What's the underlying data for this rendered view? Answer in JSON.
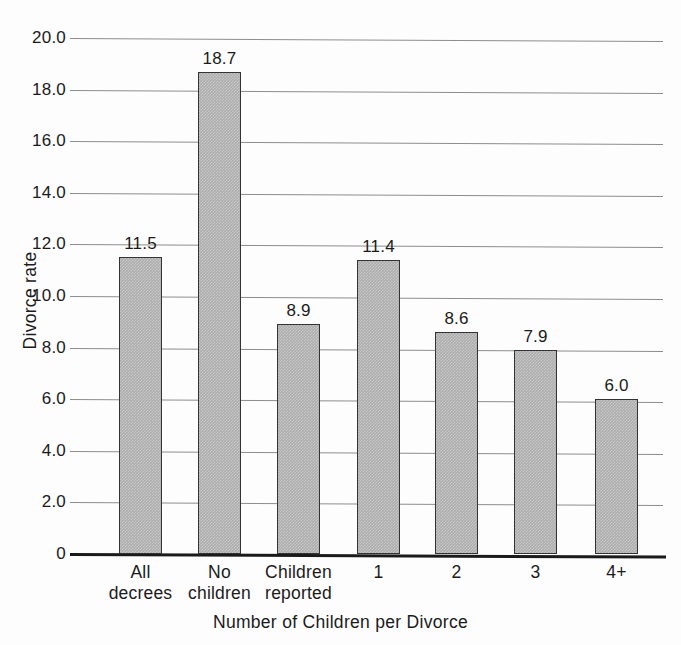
{
  "chart_data": {
    "type": "bar",
    "title": "",
    "xlabel": "Number of Children per Divorce",
    "ylabel": "Divorce rate",
    "categories": [
      "All decrees",
      "No children",
      "Children reported",
      "1",
      "2",
      "3",
      "4+"
    ],
    "category_lines": [
      [
        "All",
        "decrees"
      ],
      [
        "No",
        "children"
      ],
      [
        "Children",
        "reported"
      ],
      [
        "1"
      ],
      [
        "2"
      ],
      [
        "3"
      ],
      [
        "4+"
      ]
    ],
    "values": [
      11.5,
      18.7,
      8.9,
      11.4,
      8.6,
      7.9,
      6.0
    ],
    "value_labels": [
      "11.5",
      "18.7",
      "8.9",
      "11.4",
      "8.6",
      "7.9",
      "6.0"
    ],
    "ylim": [
      0,
      20
    ],
    "ytick_values": [
      0,
      2.0,
      4.0,
      6.0,
      8.0,
      10.0,
      12.0,
      14.0,
      16.0,
      18.0,
      20.0
    ],
    "ytick_labels": [
      "0",
      "2.0",
      "4.0",
      "6.0",
      "8.0",
      "10.0",
      "12.0",
      "14.0",
      "16.0",
      "18.0",
      "20.0"
    ],
    "grid": true,
    "grid_axis": "y",
    "legend": null,
    "bar_color": "#adadad",
    "bar_edge_color": "#333333",
    "grid_color": "#8d8d8d",
    "axis_color": "#1a1a1a",
    "text_color": "#1b1b1b",
    "background_color": "#fdfdfd"
  }
}
